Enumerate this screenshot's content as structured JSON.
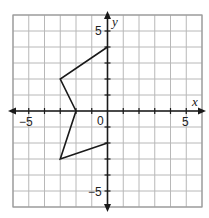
{
  "diagram": {
    "type": "coordinate-plane",
    "grid": {
      "xmin": -6,
      "xmax": 6,
      "ymin": -6,
      "ymax": 6,
      "step": 1
    },
    "axes": {
      "x_label": "x",
      "y_label": "y",
      "tick_labels": {
        "x_neg": "−5",
        "x_pos": "5",
        "y_pos": "5",
        "y_neg": "−5",
        "origin": "0"
      }
    },
    "polygon": {
      "vertices": [
        [
          0,
          4
        ],
        [
          -3,
          2
        ],
        [
          -2,
          0
        ],
        [
          -3,
          -3
        ],
        [
          0,
          -2
        ]
      ],
      "closed": false,
      "stroke": "#1a1a1a"
    },
    "colors": {
      "grid": "#b8b8b8",
      "axis": "#1a1a1a",
      "border": "#9a9a9a"
    }
  }
}
